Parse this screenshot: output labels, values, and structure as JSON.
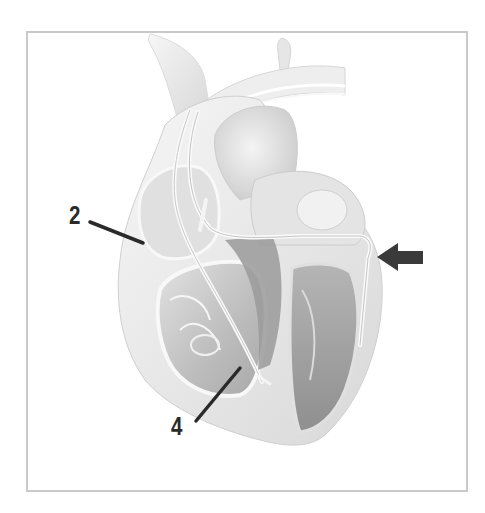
{
  "diagram": {
    "labels": [
      {
        "id": "2",
        "text": "2",
        "target": "right atrium lead region"
      },
      {
        "id": "4",
        "text": "4",
        "target": "right ventricle lead region"
      }
    ],
    "arrow": {
      "direction": "left",
      "target": "left ventricle lead (coronary sinus vein)",
      "color": "#3a3a3a"
    },
    "colors": {
      "frame_border": "#c9c9c9",
      "label_text": "#2a2a2a",
      "heart_light": "#ececec",
      "heart_mid": "#bdbdbd",
      "heart_dark": "#8c8c8c"
    }
  }
}
